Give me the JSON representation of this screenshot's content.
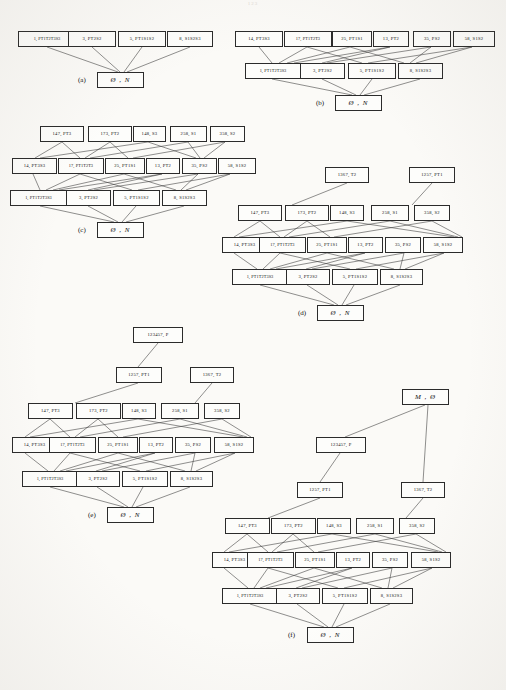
{
  "page": {
    "number": "123"
  },
  "figure": {
    "caption_labels": [
      "(a)",
      "(b)",
      "(c)",
      "(d)",
      "(e)",
      "(f)"
    ]
  },
  "labels": {
    "bottom": "Ø , N",
    "top_m": "M , Ø",
    "n1_P": "123457, P",
    "n1257": "1257, PT1",
    "n1367": "1367, T2",
    "r3_147": "147, PT3",
    "r3_173": "173, PT2",
    "r3_148": "148, S3",
    "r3_258": "258, S1",
    "r3_358": "358, S2",
    "r2_14": "14, PT3S3",
    "r2_17": "17, PT1T2T3",
    "r2_25": "25, PT1S1",
    "r2_13": "13, PT2",
    "r2_35": "35, PS2",
    "r2_58": "58, S1S2",
    "r1_1": "1, PT1T2T3S3",
    "r1_3": "3, PT2S2",
    "r1_5": "5, PT1S1S2",
    "r1_8": "8, S1S2S3"
  },
  "panels": {
    "a": {
      "label": "(a)",
      "rows": [
        [
          "1, PT1T2T3S3",
          "3, PT2S2",
          "5, PT1S1S2",
          "8, S1S2S3"
        ],
        [
          "Ø , N"
        ]
      ]
    },
    "b": {
      "label": "(b)",
      "rows": [
        [
          "14, PT3S3",
          "17, PT1T2T3",
          "25, PT1S1",
          "13, PT2",
          "35, PS2",
          "58, S1S2"
        ],
        [
          "1, PT1T2T3S3",
          "3, PT2S2",
          "5, PT1S1S2",
          "8, S1S2S3"
        ],
        [
          "Ø , N"
        ]
      ]
    },
    "c": {
      "label": "(c)",
      "rows": [
        [
          "147, PT3",
          "173, PT2",
          "148, S3",
          "258, S1",
          "358, S2"
        ],
        [
          "14, PT3S3",
          "17, PT1T2T3",
          "25, PT1S1",
          "13, PT2",
          "35, PS2",
          "58, S1S2"
        ],
        [
          "1, PT1T2T3S3",
          "3, PT2S2",
          "5, PT1S1S2",
          "8, S1S2S3"
        ],
        [
          "Ø , N"
        ]
      ]
    },
    "d": {
      "label": "(d)",
      "rows": [
        [
          "1367, T2",
          "1257, PT1"
        ],
        [
          "147, PT3",
          "173, PT2",
          "148, S3",
          "258, S1",
          "358, S2"
        ],
        [
          "14, PT3S3",
          "17, PT1T2T3",
          "25, PT1S1",
          "13, PT2",
          "35, PS2",
          "58, S1S2"
        ],
        [
          "1, PT1T2T3S3",
          "3, PT2S2",
          "5, PT1S1S2",
          "8, S1S2S3"
        ],
        [
          "Ø , N"
        ]
      ]
    },
    "e": {
      "label": "(e)",
      "rows": [
        [
          "123457, P"
        ],
        [
          "1257, PT1",
          "1367, T2"
        ],
        [
          "147, PT3",
          "173, PT2",
          "148, S3",
          "258, S1",
          "358, S2"
        ],
        [
          "14, PT3S3",
          "17, PT1T2T3",
          "25, PT1S1",
          "13, PT2",
          "35, PS2",
          "58, S1S2"
        ],
        [
          "1, PT1T2T3S3",
          "3, PT2S2",
          "5, PT1S1S2",
          "8, S1S2S3"
        ],
        [
          "Ø , N"
        ]
      ]
    },
    "f": {
      "label": "(f)",
      "rows": [
        [
          "M , Ø"
        ],
        [
          "123457, P"
        ],
        [
          "1257, PT1",
          "1367, T2"
        ],
        [
          "147, PT3",
          "173, PT2",
          "148, S3",
          "258, S1",
          "358, S2"
        ],
        [
          "14, PT3S3",
          "17, PT1T2T3",
          "25, PT1S1",
          "13, PT2",
          "35, PS2",
          "58, S1S2"
        ],
        [
          "1, PT1T2T3S3",
          "3, PT2S2",
          "5, PT1S1S2",
          "8, S1S2S3"
        ],
        [
          "Ø , N"
        ]
      ]
    }
  }
}
